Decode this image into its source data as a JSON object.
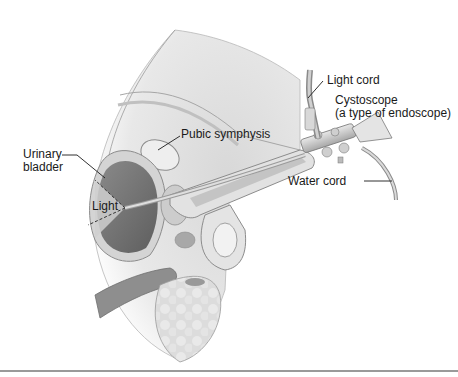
{
  "figure": {
    "type": "anatomical-diagram",
    "colors": {
      "background": "#ffffff",
      "tissue_light": "#e6e6e6",
      "tissue_mid": "#bdbdbd",
      "tissue_dark": "#7a7a7a",
      "outline": "#8c8c8c",
      "text": "#1a1a1a",
      "rule": "#9a9a9a"
    }
  },
  "labels": {
    "light_cord": "Light cord",
    "cystoscope_line1": "Cystoscope",
    "cystoscope_line2": "(a type of endoscope)",
    "pubic_symphysis": "Pubic symphysis",
    "urinary_bladder_line1": "Urinary",
    "urinary_bladder_line2": "bladder",
    "light": "Light",
    "water_cord": "Water cord"
  }
}
